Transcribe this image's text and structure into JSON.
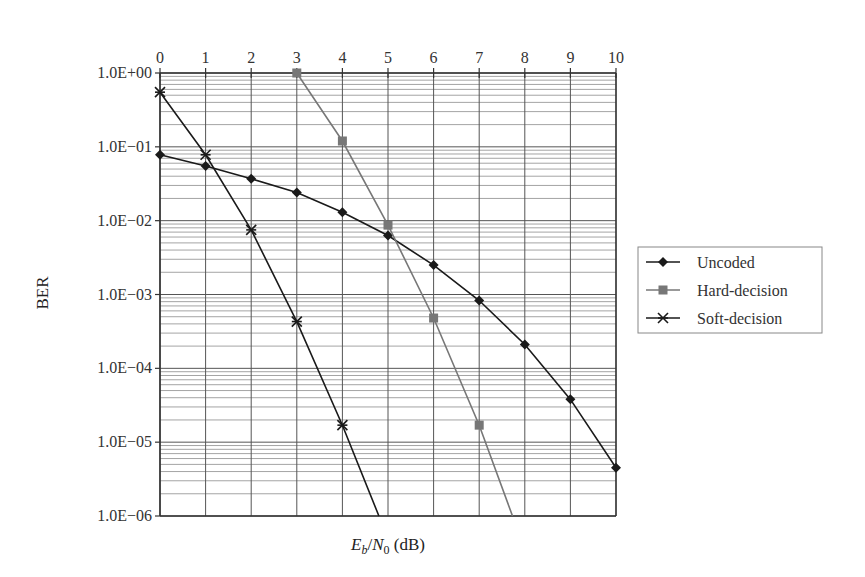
{
  "chart_data": {
    "type": "line",
    "title": "",
    "xlabel": "E_b/N_0 (dB)",
    "xlabel_parts": {
      "E": "E",
      "b": "b",
      "slash": "/",
      "N": "N",
      "zero": "0",
      "unit": " (dB)"
    },
    "ylabel": "BER",
    "x_ticks": [
      "0",
      "1",
      "2",
      "3",
      "4",
      "5",
      "6",
      "7",
      "8",
      "9",
      "10"
    ],
    "x_ticks_position": "top",
    "xlim": [
      0,
      10
    ],
    "y_scale": "log",
    "ylim": [
      1e-06,
      1
    ],
    "y_ticks": [
      {
        "value": 1,
        "label": "1.0E+00"
      },
      {
        "value": 0.1,
        "label": "1.0E−01"
      },
      {
        "value": 0.01,
        "label": "1.0E−02"
      },
      {
        "value": 0.001,
        "label": "1.0E−03"
      },
      {
        "value": 0.0001,
        "label": "1.0E−04"
      },
      {
        "value": 1e-05,
        "label": "1.0E−05"
      },
      {
        "value": 1e-06,
        "label": "1.0E−06"
      }
    ],
    "grid": true,
    "legend_position": "right",
    "series": [
      {
        "name": "Uncoded",
        "marker": "diamond",
        "color": "#1a1a1a",
        "x": [
          0,
          1,
          2,
          3,
          4,
          5,
          6,
          7,
          8,
          9,
          10
        ],
        "values": [
          0.078,
          0.055,
          0.037,
          0.024,
          0.013,
          0.0063,
          0.0025,
          0.00083,
          0.00021,
          3.8e-05,
          4.5e-06
        ]
      },
      {
        "name": "Hard-decision",
        "marker": "square",
        "color": "#777777",
        "x": [
          3,
          4,
          5,
          6,
          7,
          7.73
        ],
        "values": [
          1.0,
          0.12,
          0.0087,
          0.00048,
          1.7e-05,
          1e-06
        ],
        "marker_mask": [
          true,
          true,
          true,
          true,
          true,
          false
        ]
      },
      {
        "name": "Soft-decision",
        "marker": "star",
        "color": "#1a1a1a",
        "x": [
          0,
          1,
          2,
          3,
          4,
          4.8
        ],
        "values": [
          0.55,
          0.078,
          0.0075,
          0.00043,
          1.7e-05,
          1e-06
        ],
        "marker_mask": [
          true,
          true,
          true,
          true,
          true,
          false
        ]
      }
    ]
  }
}
